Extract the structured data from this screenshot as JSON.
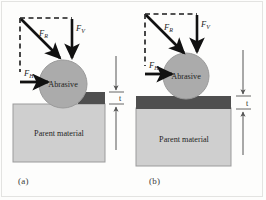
{
  "figure": {
    "background_color": "#fdfdfc",
    "frame_color": "#e3e3e1",
    "panels": [
      {
        "id": "a",
        "caption": "(a)",
        "description": "Abrasive particle embedded into groove of parent material with thin dark layer beside it",
        "forces": {
          "resultant": {
            "symbol": "F",
            "subscript": "R",
            "label": "F_R",
            "direction": "diagonal-down-right"
          },
          "vertical": {
            "symbol": "F",
            "subscript": "V",
            "label": "F_V",
            "direction": "down"
          },
          "horizontal": {
            "symbol": "F",
            "subscript": "H",
            "label": "F_H",
            "direction": "right"
          }
        },
        "abrasive_label": "Abrasive",
        "parent_label": "Parent material",
        "thickness_label": "t",
        "layer_coverage": "right-of-particle"
      },
      {
        "id": "b",
        "caption": "(b)",
        "description": "Abrasive particle resting on continuous dark layer over parent material",
        "forces": {
          "resultant": {
            "symbol": "F",
            "subscript": "R",
            "label": "F_R",
            "direction": "diagonal-down-right"
          },
          "vertical": {
            "symbol": "F",
            "subscript": "V",
            "label": "F_V",
            "direction": "down"
          },
          "horizontal": {
            "symbol": "F",
            "subscript": "H",
            "label": "F_H",
            "direction": "right"
          }
        },
        "abrasive_label": "Abrasive",
        "parent_label": "Parent material",
        "thickness_label": "t",
        "layer_coverage": "full-width"
      }
    ],
    "colors": {
      "abrasive_fill": "#ababab",
      "abrasive_stroke": "#9a9a9a",
      "parent_fill": "#cfcfcf",
      "parent_stroke": "#9b9b9b",
      "layer_fill": "#4f4f4f",
      "arrow_color": "#111111",
      "dashed_color": "#1a1a1a",
      "dimension_color": "#555555",
      "text_color": "#1f1f1f"
    }
  }
}
